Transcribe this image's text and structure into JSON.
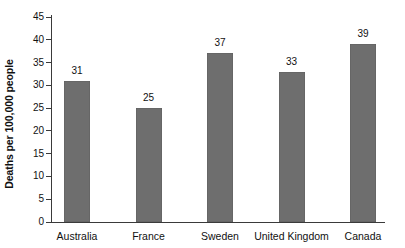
{
  "chart_data": {
    "type": "bar",
    "title": "",
    "subtitle": "",
    "xlabel": "",
    "ylabel": "Deaths per 100,000 people",
    "categories": [
      "Australia",
      "France",
      "Sweden",
      "United Kingdom",
      "Canada"
    ],
    "values": [
      31,
      25,
      37,
      33,
      39
    ],
    "value_labels": [
      "31",
      "25",
      "37",
      "33",
      "39"
    ],
    "ylim": [
      0,
      45
    ],
    "ytick_step": 5,
    "ytick_labels": [
      "0",
      "5",
      "10",
      "15",
      "20",
      "25",
      "30",
      "35",
      "40",
      "45"
    ],
    "ytick_values": [
      0,
      5,
      10,
      15,
      20,
      25,
      30,
      35,
      40,
      45
    ],
    "grid": false,
    "legend": null,
    "legend_position": "none",
    "bar_color": "#6e6e6e",
    "axis_color": "#3a3a3a",
    "text_color": "#111111",
    "background_color": "#ffffff",
    "annotations": []
  }
}
